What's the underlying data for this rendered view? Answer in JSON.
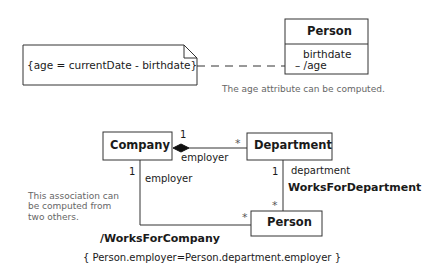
{
  "diagram": {
    "derived_attribute": {
      "note": {
        "text": "{age = currentDate - birthdate}"
      },
      "class": {
        "name": "Person",
        "attributes": [
          "birthdate",
          "– /age"
        ]
      },
      "caption": "The age attribute can be computed."
    },
    "derived_association": {
      "classes": {
        "company": "Company",
        "department": "Department",
        "person": "Person"
      },
      "composition": {
        "company_mult": "1",
        "department_mult": "*",
        "role": "employer"
      },
      "works_for_department": {
        "name": "WorksForDepartment",
        "department_mult": "1",
        "department_role": "department",
        "person_mult": "*"
      },
      "works_for_company": {
        "name": "/WorksForCompany",
        "company_mult": "1",
        "company_role": "employer",
        "person_mult": "*"
      },
      "comment": [
        "This association can",
        "be computed from",
        "two others."
      ],
      "constraint": "{ Person.employer=Person.department.employer }"
    }
  }
}
